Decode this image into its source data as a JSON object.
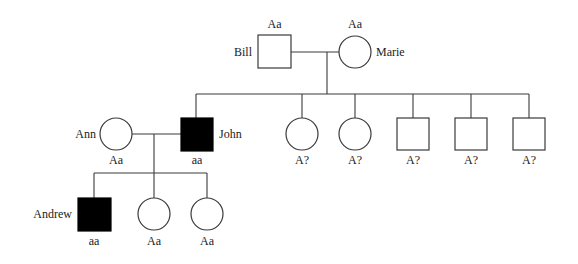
{
  "diagram": {
    "type": "pedigree",
    "colors": {
      "line": "#3a3a3a",
      "affected_fill": "#000000",
      "unaffected_fill": "#ffffff",
      "text": "#222222"
    },
    "generations": [
      {
        "id": "I",
        "individuals": [
          {
            "name": "Bill",
            "sex": "male",
            "affected": false,
            "genotype": "Aa"
          },
          {
            "name": "Marie",
            "sex": "female",
            "affected": false,
            "genotype": "Aa"
          }
        ]
      },
      {
        "id": "II",
        "individuals": [
          {
            "name": "Ann",
            "sex": "female",
            "affected": false,
            "genotype": "Aa"
          },
          {
            "name": "John",
            "sex": "male",
            "affected": true,
            "genotype": "aa"
          },
          {
            "name": "",
            "sex": "female",
            "affected": false,
            "genotype": "A?"
          },
          {
            "name": "",
            "sex": "female",
            "affected": false,
            "genotype": "A?"
          },
          {
            "name": "",
            "sex": "male",
            "affected": false,
            "genotype": "A?"
          },
          {
            "name": "",
            "sex": "male",
            "affected": false,
            "genotype": "A?"
          },
          {
            "name": "",
            "sex": "male",
            "affected": false,
            "genotype": "A?"
          }
        ]
      },
      {
        "id": "III",
        "individuals": [
          {
            "name": "Andrew",
            "sex": "male",
            "affected": true,
            "genotype": "aa"
          },
          {
            "name": "",
            "sex": "female",
            "affected": false,
            "genotype": "Aa"
          },
          {
            "name": "",
            "sex": "female",
            "affected": false,
            "genotype": "Aa"
          }
        ]
      }
    ]
  }
}
